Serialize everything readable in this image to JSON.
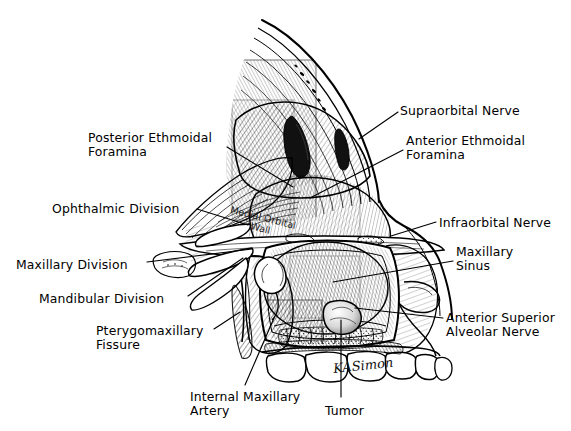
{
  "figure": {
    "background_color": "#ffffff",
    "ink_color": "#000000",
    "width": 571,
    "height": 431
  },
  "signature": {
    "text": "KASimon"
  },
  "inline_annotations": [
    {
      "name": "medial-orbital-wall",
      "line1": "Medial Orbital",
      "line2": "Wall",
      "x": 232,
      "y": 204,
      "rotation": 14
    }
  ],
  "labels": [
    {
      "name": "posterior-ethmoidal-foramina",
      "lines": [
        "Posterior Ethmoidal",
        "Foramina"
      ],
      "x": 88,
      "y": 131,
      "align": "left",
      "leader": {
        "x1": 227,
        "y1": 147,
        "x2": 293,
        "y2": 187
      }
    },
    {
      "name": "ophthalmic-division",
      "lines": [
        "Ophthalmic Division"
      ],
      "x": 52,
      "y": 202,
      "align": "left",
      "leader": {
        "x1": 197,
        "y1": 209,
        "x2": 248,
        "y2": 225
      }
    },
    {
      "name": "maxillary-division",
      "lines": [
        "Maxillary Division"
      ],
      "x": 16,
      "y": 258,
      "align": "left",
      "leader": {
        "x1": 147,
        "y1": 262,
        "x2": 252,
        "y2": 249
      }
    },
    {
      "name": "mandibular-division",
      "lines": [
        "Mandibular Division"
      ],
      "x": 39,
      "y": 292,
      "align": "left",
      "leader": {
        "x1": 188,
        "y1": 296,
        "x2": 243,
        "y2": 258
      }
    },
    {
      "name": "pterygomaxillary-fissure",
      "lines": [
        "Pterygomaxillary",
        "Fissure"
      ],
      "x": 96,
      "y": 324,
      "align": "left",
      "leader": {
        "x1": 214,
        "y1": 329,
        "x2": 240,
        "y2": 312
      }
    },
    {
      "name": "internal-maxillary-artery",
      "lines": [
        "Internal Maxillary",
        "Artery"
      ],
      "x": 190,
      "y": 390,
      "align": "left",
      "leader": {
        "x1": 245,
        "y1": 385,
        "x2": 274,
        "y2": 318
      }
    },
    {
      "name": "tumor",
      "lines": [
        "Tumor"
      ],
      "x": 325,
      "y": 404,
      "align": "left",
      "leader": {
        "x1": 341,
        "y1": 397,
        "x2": 341,
        "y2": 320
      }
    },
    {
      "name": "supraorbital-nerve",
      "lines": [
        "Supraorbital Nerve"
      ],
      "x": 400,
      "y": 104,
      "align": "left",
      "leader": {
        "x1": 398,
        "y1": 112,
        "x2": 359,
        "y2": 139
      }
    },
    {
      "name": "anterior-ethmoidal-foramina",
      "lines": [
        "Anterior Ethmoidal",
        "Foramina"
      ],
      "x": 406,
      "y": 134,
      "align": "left",
      "leader": {
        "x1": 403,
        "y1": 150,
        "x2": 310,
        "y2": 198
      }
    },
    {
      "name": "infraorbital-nerve",
      "lines": [
        "Infraorbital Nerve"
      ],
      "x": 439,
      "y": 216,
      "align": "left",
      "leader": {
        "x1": 436,
        "y1": 222,
        "x2": 391,
        "y2": 236
      }
    },
    {
      "name": "maxillary-sinus",
      "lines": [
        "Maxillary",
        "Sinus"
      ],
      "x": 456,
      "y": 245,
      "align": "left",
      "leader": {
        "x1": 453,
        "y1": 261,
        "x2": 333,
        "y2": 282
      }
    },
    {
      "name": "anterior-superior-alveolar-nerve",
      "lines": [
        "Anterior Superior",
        "Alveolar Nerve"
      ],
      "x": 446,
      "y": 311,
      "align": "left",
      "leader": {
        "x1": 443,
        "y1": 318,
        "x2": 355,
        "y2": 308
      }
    }
  ]
}
